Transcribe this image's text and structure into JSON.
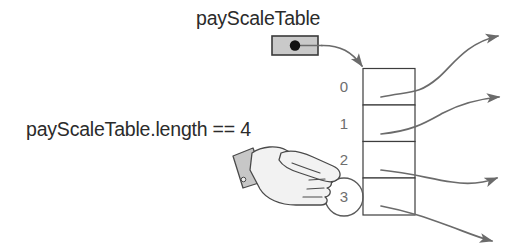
{
  "diagram": {
    "title": "payScaleTable",
    "expression": "payScaleTable.length == 4",
    "reference_box": {
      "name": "payScaleTable",
      "fill_color": "#c9c9c9",
      "dot_color": "#111111"
    },
    "array": {
      "cell_count": 4,
      "cells": [
        {
          "index": "0",
          "value": ""
        },
        {
          "index": "1",
          "value": ""
        },
        {
          "index": "2",
          "value": ""
        },
        {
          "index": "3",
          "value": ""
        }
      ],
      "highlighted_index": "3",
      "border_color": "#3d3d3d",
      "index_color": "#6e6e6e"
    },
    "pointer": {
      "icon": "pointing-hand-icon",
      "points_at": "3",
      "hand_color": "#f2f2f2",
      "cuff_color": "#c7c7c7"
    },
    "outgoing_arrows": {
      "count": 4,
      "color": "#6b6b6b"
    },
    "text_color": "#2b2b2b"
  }
}
